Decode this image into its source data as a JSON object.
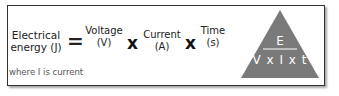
{
  "formula": {
    "result": {
      "name": "Electrical",
      "name2": "energy (J)"
    },
    "equals": "=",
    "operand1": {
      "name": "Voltage",
      "unit": "(V)"
    },
    "times1": "x",
    "operand2": {
      "name": "Current",
      "unit": "(A)"
    },
    "times2": "x",
    "operand3": {
      "name": "Time",
      "unit": "(s)"
    }
  },
  "note": "where I is current",
  "triangle": {
    "top": "E",
    "bottom": "V x I x t",
    "fill": "#7a7a7a",
    "text_color": "#ffffff"
  }
}
